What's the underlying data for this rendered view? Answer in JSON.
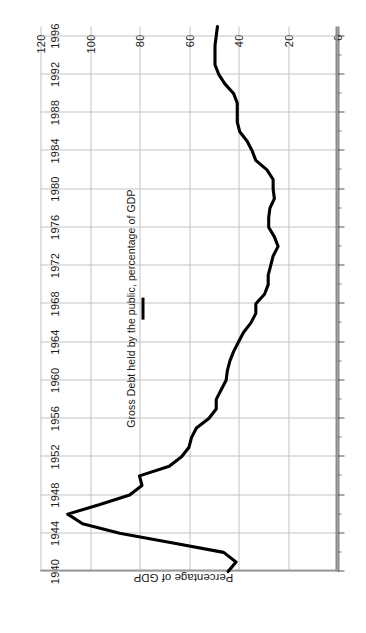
{
  "chart_data": {
    "type": "line",
    "title": "",
    "xlabel": "",
    "ylabel": "Percentage of GDP",
    "xlim": [
      1940,
      1997
    ],
    "ylim": [
      0,
      120
    ],
    "grid": true,
    "legend_position": "inside-center",
    "legend": [
      "Gross Debt held by the public, percentage of GDP"
    ],
    "series": [
      {
        "name": "Gross Debt held by the public, percentage of GDP",
        "color": "#000000",
        "x": [
          1940,
          1941,
          1942,
          1943,
          1944,
          1945,
          1946,
          1947,
          1948,
          1949,
          1950,
          1951,
          1952,
          1953,
          1954,
          1955,
          1956,
          1957,
          1958,
          1959,
          1960,
          1961,
          1962,
          1963,
          1964,
          1965,
          1966,
          1967,
          1968,
          1969,
          1970,
          1971,
          1972,
          1973,
          1974,
          1975,
          1976,
          1977,
          1978,
          1979,
          1980,
          1981,
          1982,
          1983,
          1984,
          1985,
          1986,
          1987,
          1988,
          1989,
          1990,
          1991,
          1992,
          1993,
          1994,
          1995,
          1996,
          1997
        ],
        "values": [
          44.2,
          41.0,
          46.0,
          67.0,
          88.0,
          103.0,
          109.0,
          96.0,
          84.0,
          79.0,
          80.0,
          68.0,
          63.0,
          60.0,
          59.0,
          57.0,
          52.0,
          49.0,
          49.0,
          47.0,
          45.0,
          44.5,
          43.5,
          42.0,
          40.0,
          38.0,
          35.0,
          33.0,
          33.0,
          29.5,
          28.0,
          28.0,
          27.0,
          26.0,
          24.0,
          25.5,
          27.8,
          27.8,
          27.3,
          25.5,
          26.0,
          26.0,
          28.5,
          33.0,
          34.5,
          36.5,
          39.5,
          40.5,
          40.5,
          40.5,
          42.0,
          45.5,
          48.0,
          49.5,
          49.5,
          49.5,
          49.0,
          48.5
        ]
      }
    ],
    "x_ticks_major": [
      1940,
      1944,
      1948,
      1952,
      1956,
      1960,
      1964,
      1968,
      1972,
      1976,
      1980,
      1984,
      1988,
      1992,
      1996
    ],
    "x_ticks_minor_step": 2,
    "y_ticks": [
      0,
      20,
      40,
      60,
      80,
      100,
      120
    ],
    "y_tick_labels": [
      "0",
      "20",
      "40",
      "60",
      "80",
      "100",
      "120"
    ],
    "x_tick_labels": [
      "1940",
      "1944",
      "1948",
      "1952",
      "1956",
      "1960",
      "1964",
      "1968",
      "1972",
      "1976",
      "1980",
      "1984",
      "1988",
      "1992",
      "1996"
    ]
  },
  "colors": {
    "series_line": "#000000",
    "gridline": "#c4c4c4",
    "axis": "#8a8a8a",
    "text": "#1a1a1a",
    "background": "#ffffff"
  }
}
